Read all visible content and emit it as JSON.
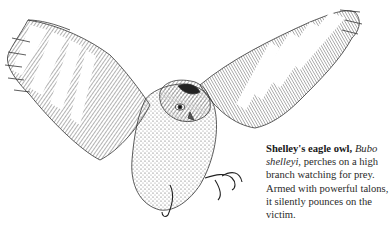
{
  "illustration": {
    "subject": "Shelley's eagle owl in flight with wings spread and talons extended",
    "style": "pen-and-ink drawing",
    "ink_color": "#333333"
  },
  "caption": {
    "title": "Shelley's eagle owl,",
    "scientific_name": "Bubo shelleyi",
    "body": ", perches on a high branch watching for prey. Armed with powerful talons, it silently pounces on the victim."
  }
}
